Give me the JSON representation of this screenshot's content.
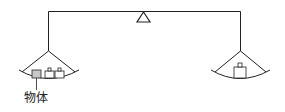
{
  "diagram": {
    "type": "balance-scale",
    "labels": {
      "object": "物体"
    },
    "colors": {
      "stroke": "#222222",
      "object_fill": "#c8c8c8",
      "weight_fill": "#ffffff"
    },
    "left_pan": {
      "items": [
        "object",
        "weight",
        "weight"
      ]
    },
    "right_pan": {
      "items": [
        "weight"
      ]
    }
  }
}
